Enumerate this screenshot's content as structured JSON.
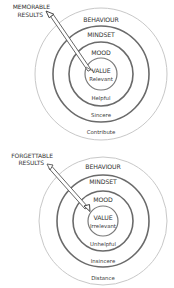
{
  "diagrams": [
    {
      "id": "memorable",
      "title_line1": "MEMORABLE",
      "title_line2": "RESULTS",
      "rings": {
        "behaviour": "BEHAVIOUR",
        "mindset": "MINDSET",
        "mood": "MOOD",
        "value": "VALUE"
      },
      "descriptors": {
        "value": "Relevant",
        "mood": "Helpful",
        "mindset": "Sincere",
        "behaviour": "Contribute"
      },
      "arrow_hits_center": true
    },
    {
      "id": "forgettable",
      "title_line1": "FORGETTABLE",
      "title_line2": "RESULTS",
      "rings": {
        "behaviour": "BEHAVIOUR",
        "mindset": "MINDSET",
        "mood": "MOOD",
        "value": "VALUE"
      },
      "descriptors": {
        "value": "Irrelevant",
        "mood": "Unhelpful",
        "mindset": "Insincere",
        "behaviour": "Distance"
      },
      "arrow_hits_center": false
    }
  ],
  "colors": {
    "ring_dark": "#6a6a6a",
    "ring_light": "#c8c8c8",
    "text": "#333333"
  }
}
